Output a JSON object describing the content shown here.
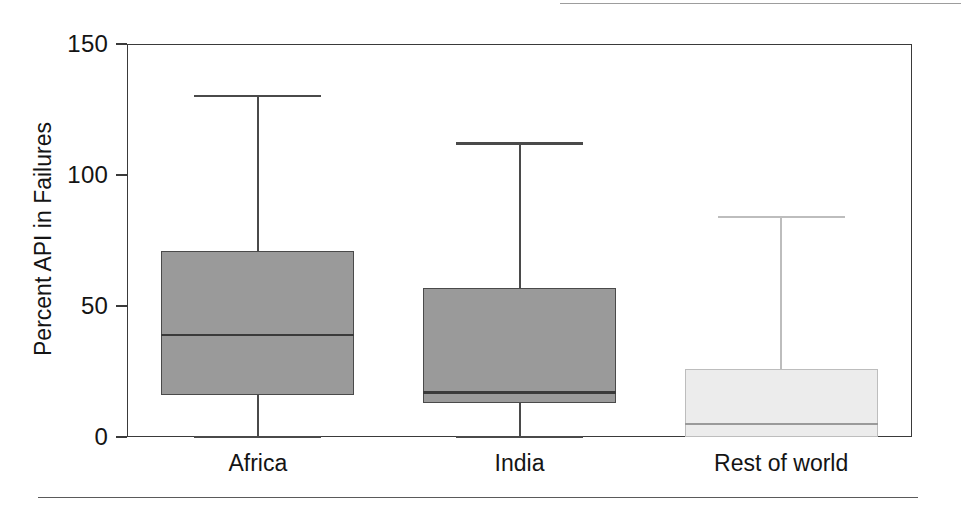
{
  "figure": {
    "width": 961,
    "height": 516,
    "background": "#ffffff",
    "top_rule_color": "#8c8c8c",
    "bottom_rule_color": "#5a5a5a",
    "frame_color": "#3a3a3a"
  },
  "axes": {
    "y_title": "Percent API in Failures",
    "y_ticks": [
      "0",
      "50",
      "100",
      "150"
    ],
    "x_labels": [
      "Africa",
      "India",
      "Rest of world"
    ]
  },
  "chart_data": {
    "type": "box",
    "title": "",
    "subtitle": "",
    "xlabel": "",
    "ylabel": "Percent API in Failures",
    "categories": [
      "Africa",
      "India",
      "Rest of world"
    ],
    "ylim": [
      0,
      150
    ],
    "yticks": [
      0,
      50,
      100,
      150
    ],
    "grid": false,
    "legend": null,
    "boxes": [
      {
        "category": "Africa",
        "whisker_low": 0,
        "q1": 16,
        "median": 39,
        "q3": 71,
        "whisker_high": 130,
        "fill": "#9a9a9a",
        "edge": "#4a4a4a",
        "median_color": "#3a3a3a"
      },
      {
        "category": "India",
        "whisker_low": 0,
        "q1": 13,
        "median": 17,
        "q3": 57,
        "whisker_high": 112,
        "fill": "#9a9a9a",
        "edge": "#4a4a4a",
        "median_color": "#3a3a3a"
      },
      {
        "category": "Rest of world",
        "whisker_low": 0,
        "q1": 0,
        "median": 5,
        "q3": 26,
        "whisker_high": 84,
        "fill": "#ececec",
        "edge": "#bdbdbd",
        "median_color": "#9a9a9a"
      }
    ]
  }
}
